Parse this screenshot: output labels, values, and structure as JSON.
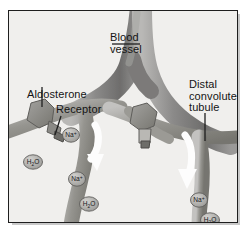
{
  "figure": {
    "kind": "anatomical-diagram",
    "style": "grayscale-illustration",
    "frame": {
      "border_color": "#1e1e1e",
      "background_color": "#f0efed",
      "shadow_color": "#c9c9c9"
    }
  },
  "labels": {
    "blood_vessel": "Blood\nvessel",
    "aldosterone": "Aldosterone",
    "receptor": "Receptor",
    "distal_tubule": "Distal\nconvoluted\ntubule"
  },
  "molecules": {
    "sodium": "Na",
    "sodium_charge": "+",
    "water": "H",
    "water_sub": "2",
    "water_tail": "O",
    "items": [
      {
        "species": "sodium",
        "x": 70,
        "y": 134
      },
      {
        "species": "water",
        "x": 32,
        "y": 161
      },
      {
        "species": "sodium",
        "x": 76,
        "y": 178
      },
      {
        "species": "water",
        "x": 88,
        "y": 203
      },
      {
        "species": "sodium",
        "x": 198,
        "y": 199
      },
      {
        "species": "water",
        "x": 209,
        "y": 219
      }
    ]
  },
  "colors": {
    "vessel_dark": "#70706f",
    "vessel_mid": "#8d8d8c",
    "vessel_light": "#b4b3b1",
    "tubule_dark": "#7d7c7b",
    "tubule_light": "#c0bfbd",
    "arrow_white": "#fdfdfd",
    "molecule_fill": "#a9a8a6",
    "label_text": "#141414",
    "leader_line": "#202020"
  },
  "elements": {
    "blood_vessel_name": "blood-vessel",
    "distal_tubule_name": "distal-convoluted-tubule",
    "aldosterone_name": "aldosterone-molecule",
    "receptor_name": "receptor"
  }
}
